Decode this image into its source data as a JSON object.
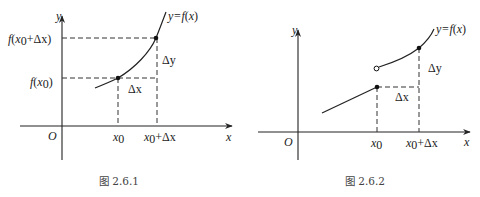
{
  "figures": [
    {
      "id": "fig1",
      "caption": "图 2.6.1",
      "axis_labels": {
        "x": "x",
        "y": "y",
        "origin": "O"
      },
      "function_label": "y=f(x)",
      "x_ticks": [
        "x0",
        "x0+Δx"
      ],
      "y_ticks": [
        "f(x0)",
        "f(x0+Δx)"
      ],
      "increment_labels": {
        "dx": "Δx",
        "dy": "Δy"
      },
      "points": [
        {
          "name": "P0",
          "x": "x0",
          "y": "f(x0)",
          "style": "filled"
        },
        {
          "name": "P1",
          "x": "x0+Δx",
          "y": "f(x0+Δx)",
          "style": "filled"
        }
      ],
      "description": "Continuous increasing convex curve y=f(x) with increments Δx and Δy marked by dashed lines"
    },
    {
      "id": "fig2",
      "caption": "图 2.6.2",
      "axis_labels": {
        "x": "x",
        "y": "y",
        "origin": "O"
      },
      "function_label": "y=f(x)",
      "x_ticks": [
        "x0",
        "x0+Δx"
      ],
      "increment_labels": {
        "dx": "Δx",
        "dy": "Δy"
      },
      "points": [
        {
          "name": "P0",
          "x": "x0",
          "y": "f(x0)",
          "style": "filled"
        },
        {
          "name": "jump",
          "x": "x0",
          "y": "limit from right",
          "style": "open"
        },
        {
          "name": "P1",
          "x": "x0+Δx",
          "y": "f(x0+Δx)",
          "style": "filled"
        }
      ],
      "description": "Function with a jump discontinuity at x0: linear segment ending at filled point, curve starting at open circle above"
    }
  ],
  "labels": {
    "y": "y",
    "x": "x",
    "O": "O",
    "f": "f",
    "lp": "(",
    "rp": ")",
    "x0_base": "x",
    "sub0": "0",
    "plus_dx": "+Δx",
    "dx": "Δx",
    "dy": "Δy",
    "yeq": "y=f",
    "px": "(x)",
    "fig1_caption": "图 2.6.1",
    "fig2_caption": "图 2.6.2"
  }
}
